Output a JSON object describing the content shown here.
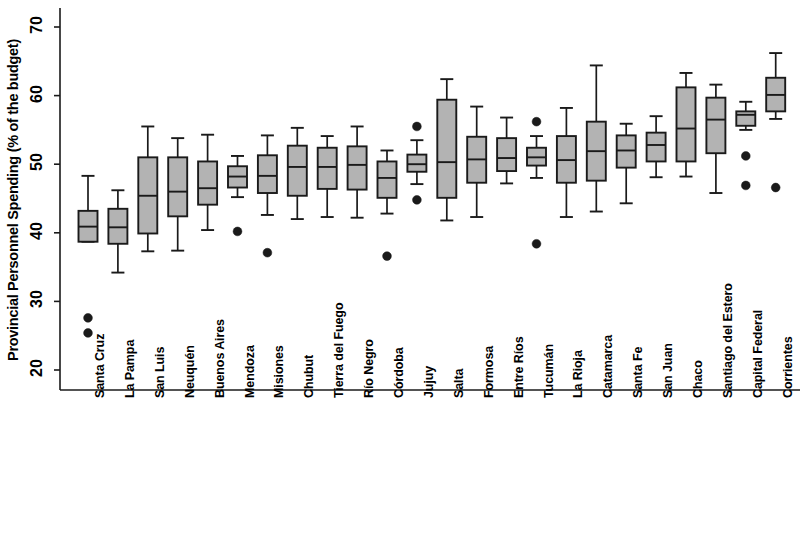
{
  "chart_data": {
    "type": "box",
    "title": "",
    "xlabel": "",
    "ylabel": "Provincial Personnel Spending (% of the budget)",
    "ylim": [
      17.5,
      72
    ],
    "yticks": [
      20,
      30,
      40,
      50,
      60,
      70
    ],
    "ytick_labels": [
      "20",
      "30",
      "40",
      "50",
      "60",
      "70"
    ],
    "grid": false,
    "legend": "none",
    "box_fill_color": "#b3b3b3",
    "box_edge_color": "#1a1a1a",
    "outlier_color": "#1a1a1a",
    "categories": [
      "Santa Cruz",
      "La Pampa",
      "San Luis",
      "Neuquén",
      "Buenos Aires",
      "Mendoza",
      "Misiones",
      "Chubut",
      "Tierra del Fuego",
      "Río Negro",
      "Córdoba",
      "Jujuy",
      "Salta",
      "Formosa",
      "Entre Ríos",
      "Tucumán",
      "La Rioja",
      "Catamarca",
      "Santa Fe",
      "San Juan",
      "Chaco",
      "Santiago del Estero",
      "Capital Federal",
      "Corrientes"
    ],
    "boxes": [
      {
        "category": "Santa Cruz",
        "whisker_low": 38.7,
        "q1": 38.7,
        "median": 40.9,
        "q3": 43.2,
        "whisker_high": 48.3,
        "outliers": [
          27.6,
          25.4
        ]
      },
      {
        "category": "La Pampa",
        "whisker_low": 34.2,
        "q1": 38.4,
        "median": 40.8,
        "q3": 43.5,
        "whisker_high": 46.2,
        "outliers": []
      },
      {
        "category": "San Luis",
        "whisker_low": 37.3,
        "q1": 39.9,
        "median": 45.4,
        "q3": 51.0,
        "whisker_high": 55.5,
        "outliers": []
      },
      {
        "category": "Neuquén",
        "whisker_low": 37.4,
        "q1": 42.4,
        "median": 46.0,
        "q3": 51.0,
        "whisker_high": 53.8,
        "outliers": []
      },
      {
        "category": "Buenos Aires",
        "whisker_low": 40.4,
        "q1": 44.1,
        "median": 46.5,
        "q3": 50.4,
        "whisker_high": 54.3,
        "outliers": []
      },
      {
        "category": "Mendoza",
        "whisker_low": 45.2,
        "q1": 46.6,
        "median": 48.2,
        "q3": 49.7,
        "whisker_high": 51.2,
        "outliers": [
          40.2
        ]
      },
      {
        "category": "Misiones",
        "whisker_low": 42.6,
        "q1": 45.8,
        "median": 48.3,
        "q3": 51.3,
        "whisker_high": 54.2,
        "outliers": [
          37.1
        ]
      },
      {
        "category": "Chubut",
        "whisker_low": 42.0,
        "q1": 45.4,
        "median": 49.6,
        "q3": 52.7,
        "whisker_high": 55.3,
        "outliers": []
      },
      {
        "category": "Tierra del Fuego",
        "whisker_low": 42.3,
        "q1": 46.4,
        "median": 49.6,
        "q3": 52.4,
        "whisker_high": 54.1,
        "outliers": []
      },
      {
        "category": "Río Negro",
        "whisker_low": 42.2,
        "q1": 46.3,
        "median": 49.9,
        "q3": 52.6,
        "whisker_high": 55.5,
        "outliers": []
      },
      {
        "category": "Córdoba",
        "whisker_low": 42.8,
        "q1": 45.1,
        "median": 48.0,
        "q3": 50.4,
        "whisker_high": 52.0,
        "outliers": [
          36.6
        ]
      },
      {
        "category": "Jujuy",
        "whisker_low": 47.1,
        "q1": 48.9,
        "median": 50.0,
        "q3": 51.4,
        "whisker_high": 53.5,
        "outliers": [
          55.5,
          44.8
        ]
      },
      {
        "category": "Salta",
        "whisker_low": 41.8,
        "q1": 45.1,
        "median": 50.3,
        "q3": 59.4,
        "whisker_high": 62.4,
        "outliers": []
      },
      {
        "category": "Formosa",
        "whisker_low": 42.3,
        "q1": 47.3,
        "median": 50.7,
        "q3": 54.0,
        "whisker_high": 58.4,
        "outliers": []
      },
      {
        "category": "Entre Ríos",
        "whisker_low": 47.2,
        "q1": 49.0,
        "median": 50.9,
        "q3": 53.8,
        "whisker_high": 56.8,
        "outliers": []
      },
      {
        "category": "Tucumán",
        "whisker_low": 48.0,
        "q1": 49.8,
        "median": 51.0,
        "q3": 52.4,
        "whisker_high": 54.1,
        "outliers": [
          56.2,
          38.4
        ]
      },
      {
        "category": "La Rioja",
        "whisker_low": 42.3,
        "q1": 47.3,
        "median": 50.6,
        "q3": 54.1,
        "whisker_high": 58.2,
        "outliers": []
      },
      {
        "category": "Catamarca",
        "whisker_low": 43.1,
        "q1": 47.6,
        "median": 51.9,
        "q3": 56.2,
        "whisker_high": 64.4,
        "outliers": []
      },
      {
        "category": "Santa Fe",
        "whisker_low": 44.3,
        "q1": 49.5,
        "median": 52.0,
        "q3": 54.2,
        "whisker_high": 55.9,
        "outliers": []
      },
      {
        "category": "San Juan",
        "whisker_low": 48.1,
        "q1": 50.4,
        "median": 52.8,
        "q3": 54.6,
        "whisker_high": 57.0,
        "outliers": []
      },
      {
        "category": "Chaco",
        "whisker_low": 48.2,
        "q1": 50.4,
        "median": 55.2,
        "q3": 61.2,
        "whisker_high": 63.3,
        "outliers": []
      },
      {
        "category": "Santiago del Estero",
        "whisker_low": 45.8,
        "q1": 51.6,
        "median": 56.5,
        "q3": 59.7,
        "whisker_high": 61.6,
        "outliers": []
      },
      {
        "category": "Capital Federal",
        "whisker_low": 55.0,
        "q1": 55.6,
        "median": 57.2,
        "q3": 57.7,
        "whisker_high": 59.1,
        "outliers": [
          51.2,
          46.9
        ]
      },
      {
        "category": "Corrientes",
        "whisker_low": 56.6,
        "q1": 57.7,
        "median": 60.1,
        "q3": 62.6,
        "whisker_high": 66.2,
        "outliers": [
          46.6
        ]
      }
    ]
  }
}
